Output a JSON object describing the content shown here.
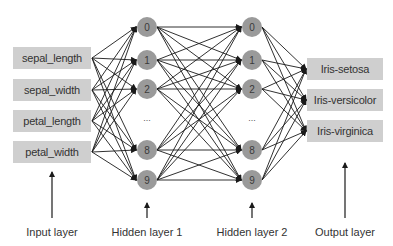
{
  "diagram": {
    "type": "neural-network",
    "input_layer": {
      "label": "Input layer",
      "features": [
        "sepal_length",
        "sepal_width",
        "petal_length",
        "petal_width"
      ]
    },
    "hidden_layer_1": {
      "label": "Hidden layer 1",
      "nodes": [
        "0",
        "1",
        "2",
        "8",
        "9"
      ],
      "ellipsis": "..."
    },
    "hidden_layer_2": {
      "label": "Hidden layer 2",
      "nodes": [
        "0",
        "1",
        "2",
        "8",
        "9"
      ],
      "ellipsis": "..."
    },
    "output_layer": {
      "label": "Output layer",
      "classes": [
        "Iris-setosa",
        "Iris-versicolor",
        "Iris-virginica"
      ]
    },
    "colors": {
      "box_fill": "#cfcfcf",
      "node_fill": "#9a9a9a",
      "edge": "#1a1a1a",
      "text": "#333333"
    }
  }
}
